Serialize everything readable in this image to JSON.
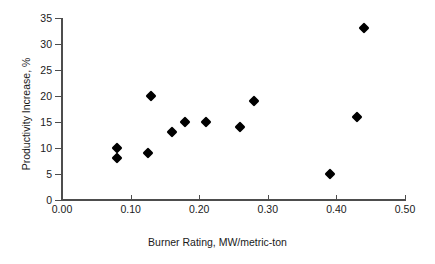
{
  "chart_data": {
    "type": "scatter",
    "title": "",
    "xlabel": "Burner Rating, MW/metric-ton",
    "ylabel": "Productivity Increase, %",
    "xlim": [
      0.0,
      0.5
    ],
    "ylim": [
      0,
      35
    ],
    "grid": false,
    "legend": "none",
    "marker": "filled-diamond",
    "marker_color": "#000000",
    "axis_color": "#4d4d4d",
    "xticks": [
      "0.00",
      "0.10",
      "0.20",
      "0.30",
      "0.40",
      "0.50"
    ],
    "xtick_values": [
      0.0,
      0.1,
      0.2,
      0.3,
      0.4,
      0.5
    ],
    "yticks": [
      "0",
      "5",
      "10",
      "15",
      "20",
      "25",
      "30",
      "35"
    ],
    "ytick_values": [
      0,
      5,
      10,
      15,
      20,
      25,
      30,
      35
    ],
    "points": [
      {
        "x": 0.08,
        "y": 10
      },
      {
        "x": 0.08,
        "y": 8
      },
      {
        "x": 0.125,
        "y": 9
      },
      {
        "x": 0.13,
        "y": 20
      },
      {
        "x": 0.16,
        "y": 13
      },
      {
        "x": 0.18,
        "y": 15
      },
      {
        "x": 0.21,
        "y": 15
      },
      {
        "x": 0.26,
        "y": 14
      },
      {
        "x": 0.28,
        "y": 19
      },
      {
        "x": 0.39,
        "y": 5
      },
      {
        "x": 0.43,
        "y": 16
      },
      {
        "x": 0.44,
        "y": 33
      }
    ]
  }
}
